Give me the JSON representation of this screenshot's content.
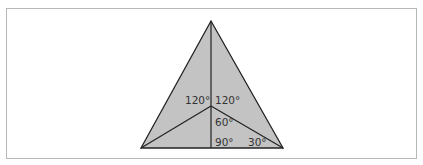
{
  "diagram": {
    "type": "triangle-angle-diagram",
    "colors": {
      "fill": "#c3c3c3",
      "stroke": "#222222",
      "frame": "#b8b8b8",
      "text": "#333333"
    },
    "vertices": {
      "apex": [
        211,
        21
      ],
      "bottom_left": [
        141,
        148
      ],
      "bottom_right": [
        283,
        148
      ],
      "interior": [
        211,
        106
      ],
      "base_foot": [
        211,
        148
      ]
    },
    "labels": {
      "angle_top_left": "120°",
      "angle_top_right": "120°",
      "angle_middle": "60°",
      "angle_right": "90°",
      "angle_bottom_right": "30°"
    }
  }
}
